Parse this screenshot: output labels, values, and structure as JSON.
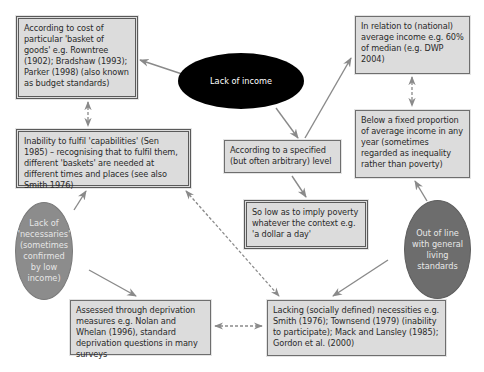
{
  "colors": {
    "box_fill": "#dcdcdc",
    "box_border": "#6e6e6e",
    "arrow": "#8a8a8a",
    "ellipse_income": "#000000",
    "ellipse_necessaries": "#8c8c8c",
    "ellipse_living": "#6d6d6d"
  },
  "nodes": {
    "lack_of_income": {
      "label": "Lack of income",
      "shape": "ellipse"
    },
    "lack_of_necessaries": {
      "label": "Lack of 'necessaries' (sometimes confirmed by low income)",
      "shape": "ellipse"
    },
    "out_of_line": {
      "label": "Out of line with general living standards",
      "shape": "ellipse"
    },
    "basket_of_goods": {
      "label": "According to cost of particular 'basket of goods' e.g. Rowntree (1902); Bradshaw (1993); Parker (1998) (also known as budget standards)",
      "border": "double"
    },
    "national_average": {
      "label": "In relation to (national) average income e.g. 60% of median (e.g. DWP 2004)",
      "border": "single"
    },
    "capabilities": {
      "label": "Inability to fulfil 'capabilities' (Sen 1985) – recognising that to fulfil them, different 'baskets' are needed at different times and places (see also Smith 1976)",
      "border": "double"
    },
    "specified_level": {
      "label": "According to a specified (but often arbitrary) level",
      "border": "single"
    },
    "fixed_proportion": {
      "label": "Below a fixed proportion of average income in any year (sometimes regarded as inequality rather than poverty)",
      "border": "single"
    },
    "dollar_a_day": {
      "label": "So low as to imply poverty whatever the context e.g. 'a dollar a day'",
      "border": "double"
    },
    "deprivation_measures": {
      "label": "Assessed through deprivation measures e.g. Nolan and Whelan (1996), standard deprivation questions in many surveys",
      "border": "single"
    },
    "socially_defined": {
      "label": "Lacking (socially defined) necessities e.g. Smith (1976); Townsend (1979) (inability to participate); Mack and Lansley (1985); Gordon et al. (2000)",
      "border": "single"
    }
  },
  "edges": [
    {
      "from": "lack_of_income",
      "to": "basket_of_goods",
      "style": "solid"
    },
    {
      "from": "lack_of_income",
      "to": "specified_level",
      "style": "solid"
    },
    {
      "from": "specified_level",
      "to": "national_average",
      "style": "solid"
    },
    {
      "from": "specified_level",
      "to": "dollar_a_day",
      "style": "solid"
    },
    {
      "from": "basket_of_goods",
      "to": "capabilities",
      "style": "dashed-bidirectional"
    },
    {
      "from": "national_average",
      "to": "fixed_proportion",
      "style": "dashed-bidirectional"
    },
    {
      "from": "lack_of_necessaries",
      "to": "capabilities",
      "style": "solid"
    },
    {
      "from": "lack_of_necessaries",
      "to": "deprivation_measures",
      "style": "solid"
    },
    {
      "from": "out_of_line",
      "to": "fixed_proportion",
      "style": "solid"
    },
    {
      "from": "out_of_line",
      "to": "socially_defined",
      "style": "solid"
    },
    {
      "from": "capabilities",
      "to": "socially_defined",
      "style": "dashed-bidirectional"
    },
    {
      "from": "deprivation_measures",
      "to": "socially_defined",
      "style": "dashed-bidirectional"
    }
  ]
}
